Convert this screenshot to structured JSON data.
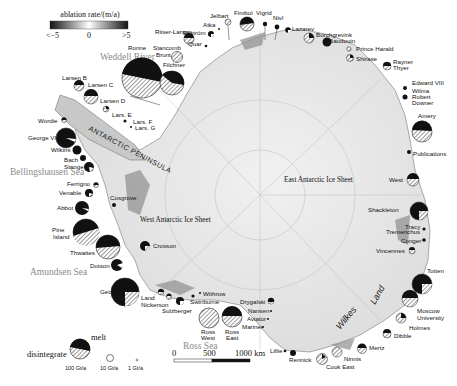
{
  "colorbar": {
    "title": "ablation rate/(m/a)",
    "min_label": "<−5",
    "mid_label": "0",
    "max_label": ">5",
    "gradient": [
      "#111111",
      "#ffffff",
      "#111111"
    ]
  },
  "seas": {
    "weddell": "Weddell River",
    "bellingshausen": "Bellingshausen Sea",
    "amundsen": "Amundsen Sea",
    "ross": "Ross Sea"
  },
  "regions": {
    "east_sheet": "East Antarctic Ice Sheet",
    "west_sheet": "West Antarctic Ice Sheet",
    "peninsula": "ANTARCTIC PENINSULA",
    "wilkes": "Wilkes",
    "land": "Land"
  },
  "ice_shelves": {
    "jelbart": "Jelbart",
    "fimbul": "Fimbul",
    "vigrid": "Vigrid",
    "nivl": "Nivl",
    "atka": "Atka",
    "ekstrom": "Ekström",
    "quar": "Quar",
    "lazarev": "Lazarev",
    "borchgrevink": "Borchgrevink",
    "baudouin": "Baudouin",
    "prince_harald": "Prince Harald",
    "shirase": "Shirase",
    "rayner": "Rayner",
    "thyer": "Thyer",
    "edward": "Edward VIII",
    "wilma": "Wilma",
    "robert": "Robert",
    "downer": "Downer",
    "amery": "Amery",
    "publications": "Publications",
    "west": "West",
    "shackleton": "Shackleton",
    "tracy": "Tracy",
    "tremenchus": "Tremenchus",
    "conger": "Conger",
    "vincennes": "Vincennes",
    "totten": "Totten",
    "moscow": "Moscow",
    "university": "University",
    "holmes": "Holmes",
    "dibble": "Dibble",
    "mertz": "Mertz",
    "ninnis": "Ninnis",
    "cook_east": "Cook East",
    "rennick": "Rennick",
    "lillie": "Lillie",
    "mariner": "Mariner",
    "aviator": "Aviator",
    "nansen": "Nansen",
    "drygalski": "Drygalski",
    "ross_east_1": "Ross",
    "ross_east_2": "East",
    "ross_west_1": "Ross",
    "ross_west_2": "West",
    "withrow": "Withrow",
    "swinburne": "Swinburne",
    "sulzberger": "Sulzberger",
    "land": "Land",
    "nickerson": "Nickerson",
    "getz": "Getz",
    "crosson": "Crosson",
    "dotson": "Dotson",
    "thwaites": "Thwaites",
    "pine_1": "Pine",
    "pine_2": "Island",
    "abbot": "Abbot",
    "cosgrove": "Cosgrove",
    "venable": "Venable",
    "ferrigno": "Ferrigno",
    "stange": "Stange",
    "bach": "Bach",
    "wilkins": "Wilkins",
    "george": "George VI",
    "wordie": "Wordie",
    "larsen_b": "Larsen B",
    "larsen_c": "Larsen C",
    "larsen_d": "Larsen D",
    "lars_e": "Lars. E",
    "lars_f": "Lars. F",
    "lars_g": "Lars. G",
    "ronne": "Ronne",
    "filchner": "Filchner",
    "stancomb_1": "Stancomb",
    "stancomb_2": "Brunt",
    "riiser": "Riiser-Larsen"
  },
  "legend": {
    "melt": "melt",
    "disintegrate": "disintegrate",
    "sizes": [
      "100 Gt/a",
      "10 Gt/a",
      "1 Gt/a"
    ]
  },
  "scale_bar": {
    "ticks": [
      "0",
      "500",
      "1000 km"
    ]
  }
}
